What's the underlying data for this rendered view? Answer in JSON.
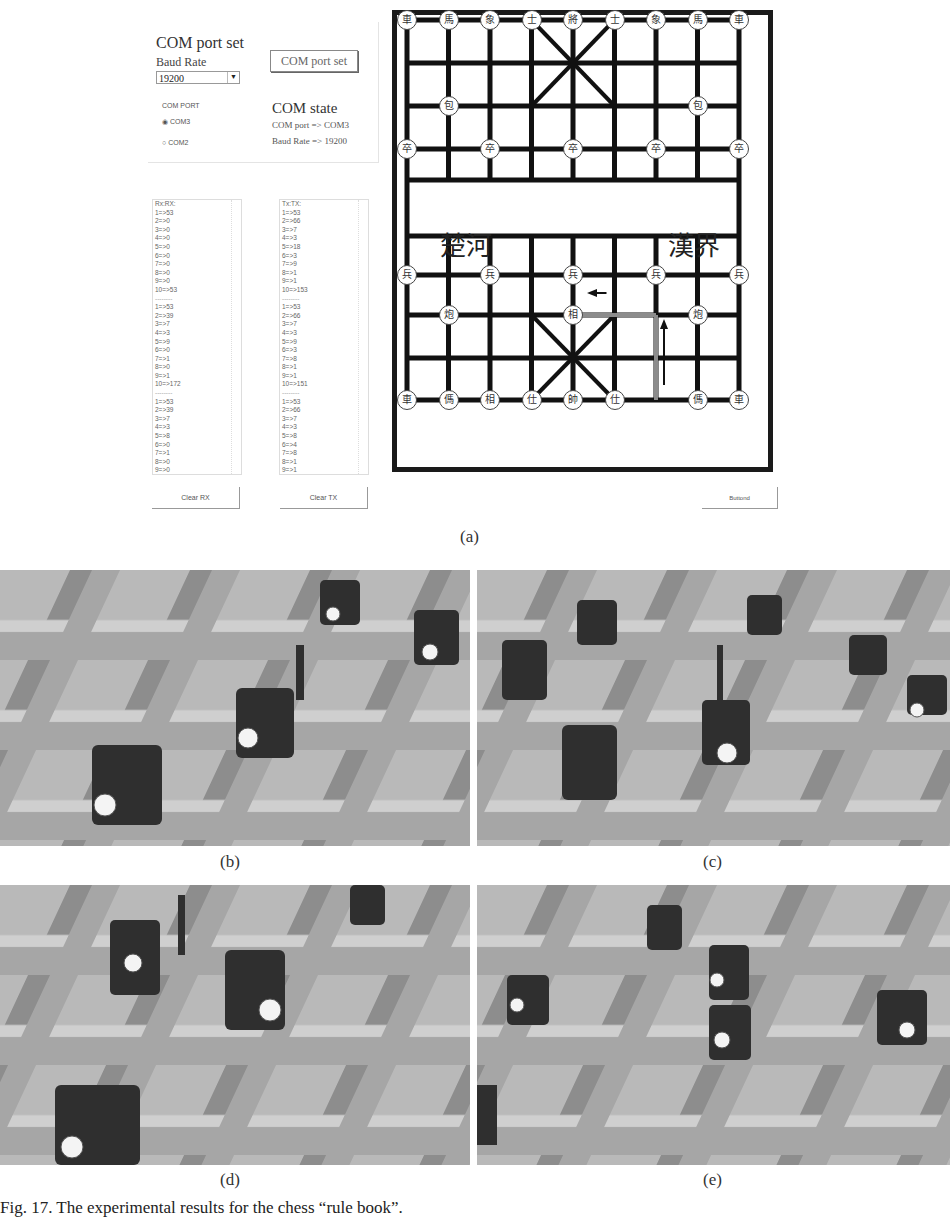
{
  "figure": {
    "panel_a_label": "(a)",
    "panel_b_label": "(b)",
    "panel_c_label": "(c)",
    "panel_d_label": "(d)",
    "panel_e_label": "(e)",
    "caption": "Fig. 17. The experimental results for the chess “rule book”."
  },
  "com_panel": {
    "title": "COM port set",
    "baud_label": "Baud Rate",
    "baud_value": "19200",
    "set_button": "COM port set",
    "com_port_label": "COM PORT",
    "radio_com3": "COM3",
    "radio_com2": "COM2",
    "radio_selected": "COM3",
    "state_title": "COM state",
    "state_port": "COM port => COM3",
    "state_baud": "Baud Rate => 19200"
  },
  "rx_list": {
    "header": "Rx:RX:",
    "blocks": [
      [
        "1=>53",
        "2=>0",
        "3=>0",
        "4=>0",
        "5=>0",
        "6=>0",
        "7=>0",
        "8=>0",
        "9=>0",
        "10=>53"
      ],
      [
        "1=>53",
        "2=>39",
        "3=>7",
        "4=>3",
        "5=>9",
        "6=>0",
        "7=>1",
        "8=>0",
        "9=>1",
        "10=>172"
      ],
      [
        "1=>53",
        "2=>39",
        "3=>7",
        "4=>3",
        "5=>8",
        "6=>0",
        "7=>1",
        "8=>0",
        "9=>0",
        "10=>175"
      ]
    ],
    "separator": "--------",
    "clear_button": "Clear RX"
  },
  "tx_list": {
    "header": "Tx:TX:",
    "blocks": [
      [
        "1=>53",
        "2=>66",
        "3=>7",
        "4=>3",
        "5=>18",
        "6=>3",
        "7=>9",
        "8=>1",
        "9=>1",
        "10=>153"
      ],
      [
        "1=>53",
        "2=>66",
        "3=>7",
        "4=>3",
        "5=>9",
        "6=>3",
        "7=>8",
        "8=>1",
        "9=>1",
        "10=>151"
      ],
      [
        "1=>53",
        "2=>66",
        "3=>7",
        "4=>3",
        "5=>8",
        "6=>4",
        "7=>8",
        "8=>1",
        "9=>1",
        "10=>151"
      ]
    ],
    "separator": "--------",
    "clear_button": "Clear TX"
  },
  "board": {
    "river_left": "楚河",
    "river_right": "漢界",
    "top_row": [
      "車",
      "馬",
      "象",
      "士",
      "將",
      "士",
      "象",
      "馬",
      "車"
    ],
    "top_cannons": [
      "包",
      "包"
    ],
    "top_pawns": [
      "卒",
      "卒",
      "卒",
      "卒",
      "卒"
    ],
    "bottom_pawns": [
      "兵",
      "兵",
      "兵",
      "兵",
      "兵"
    ],
    "bottom_cannons": [
      "炮",
      "相",
      "炮"
    ],
    "bottom_row": [
      "車",
      "傌",
      "相",
      "仕",
      "帥",
      "仕",
      "傌",
      "車"
    ],
    "path_color": "#8c8c8c",
    "button": "Buttond"
  }
}
